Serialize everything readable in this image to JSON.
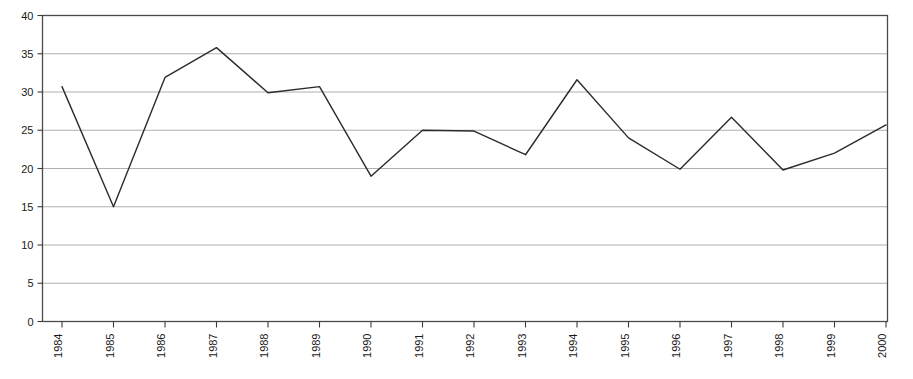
{
  "chart_data": {
    "type": "line",
    "title": "",
    "subtitle": "",
    "xlabel": "",
    "ylabel": "",
    "categories": [
      "1984",
      "1985",
      "1986",
      "1987",
      "1988",
      "1989",
      "1990",
      "1991",
      "1992",
      "1993",
      "1994",
      "1995",
      "1996",
      "1997",
      "1998",
      "1999",
      "2000"
    ],
    "values": [
      30.7,
      15.0,
      31.9,
      35.8,
      29.9,
      30.7,
      19.0,
      25.0,
      24.9,
      21.8,
      31.6,
      24.0,
      19.9,
      26.7,
      19.8,
      22.0,
      25.7
    ],
    "series": [
      {
        "name": "",
        "values": [
          30.7,
          15.0,
          31.9,
          35.8,
          29.9,
          30.7,
          19.0,
          25.0,
          24.9,
          21.8,
          31.6,
          24.0,
          19.9,
          26.7,
          19.8,
          22.0,
          25.7
        ]
      }
    ],
    "ylim": [
      0,
      40
    ],
    "xlim": [
      "1984",
      "2000"
    ],
    "yticks": [
      0,
      5,
      10,
      15,
      20,
      25,
      30,
      35,
      40
    ],
    "ytick_labels": [
      "0",
      "5",
      "10",
      "15",
      "20",
      "25",
      "30",
      "35",
      "40"
    ],
    "xtick_labels": [
      "1984",
      "1985",
      "1986",
      "1987",
      "1988",
      "1989",
      "1990",
      "1991",
      "1992",
      "1993",
      "1994",
      "1995",
      "1996",
      "1997",
      "1998",
      "1999",
      "2000"
    ],
    "xtick_label_rotation": -90,
    "grid": {
      "horizontal": true,
      "vertical": false,
      "color": "#9a9a9a"
    },
    "legend": {
      "visible": false,
      "position": "none",
      "entries": []
    },
    "annotations": [],
    "colors": {
      "line": "#2b2b2b",
      "plot_border": "#4a4a4a",
      "grid": "#9a9a9a",
      "background": "#ffffff",
      "text": "#1a1a1a"
    },
    "line_width": 1.4,
    "markers": false
  }
}
